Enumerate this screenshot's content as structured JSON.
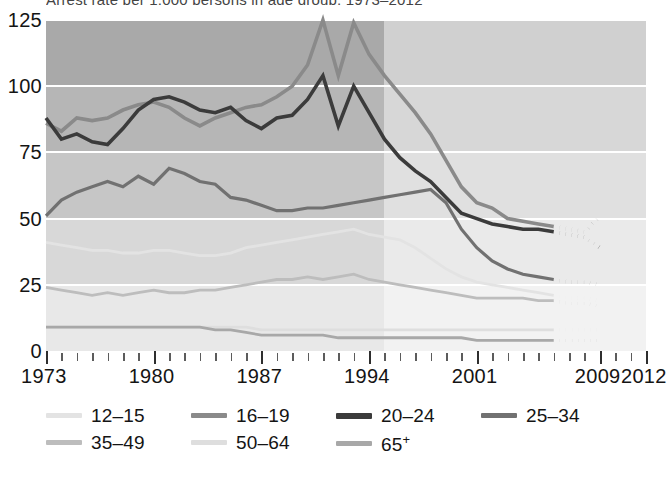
{
  "title_sliver": "Arrest rate per 1,000 persons in age group, 1973–2012",
  "axes": {
    "y_ticks": [
      0,
      25,
      50,
      75,
      100,
      125
    ],
    "y_min": 0,
    "y_max": 125,
    "x_labels": [
      "1973",
      "1980",
      "1987",
      "1994",
      "2001",
      "2009",
      "2012"
    ],
    "x_label_years": [
      1973,
      1980,
      1987,
      1994,
      2001,
      2009,
      2012
    ],
    "x_min": 1973,
    "x_max": 2012
  },
  "legend": {
    "row1": [
      {
        "label": "12–15",
        "color": "#e3e3e3",
        "key": "12-15"
      },
      {
        "label": "16–19",
        "color": "#8a8a8a",
        "key": "16-19"
      },
      {
        "label": "20–24",
        "color": "#3b3b3b",
        "key": "20-24"
      },
      {
        "label": "25–34",
        "color": "#717171",
        "key": "25-34"
      }
    ],
    "row2": [
      {
        "label": "35–49",
        "color": "#bdbdbd",
        "key": "35-49"
      },
      {
        "label": "50–64",
        "color": "#dedede",
        "key": "50-64"
      },
      {
        "label": "65",
        "sup": "+",
        "color": "#a8a8a8",
        "key": "65+"
      }
    ]
  },
  "chart_data": {
    "type": "line",
    "title": "Arrest rate per 1,000 persons in age group, 1973–2012",
    "xlabel": "",
    "ylabel": "",
    "xlim": [
      1973,
      2012
    ],
    "ylim": [
      0,
      125
    ],
    "grid": true,
    "grid_style": "horizontal white gridlines over gray bands",
    "legend_position": "below-plot",
    "x": [
      1973,
      1974,
      1975,
      1976,
      1977,
      1978,
      1979,
      1980,
      1981,
      1982,
      1983,
      1984,
      1985,
      1986,
      1987,
      1988,
      1989,
      1990,
      1991,
      1992,
      1993,
      1994,
      1995,
      1996,
      1997,
      1998,
      1999,
      2000,
      2001,
      2002,
      2003,
      2004,
      2005,
      2006,
      2007,
      2008,
      2009
    ],
    "series": [
      {
        "name": "12–15",
        "color": "#e3e3e3",
        "values": [
          41,
          40,
          39,
          38,
          38,
          37,
          37,
          38,
          38,
          37,
          36,
          36,
          37,
          39,
          40,
          41,
          42,
          43,
          44,
          45,
          46,
          44,
          43,
          42,
          39,
          35,
          31,
          28,
          26,
          25,
          24,
          23,
          22,
          21,
          20,
          20,
          19
        ],
        "dotted_gap_years": [
          2007,
          2008
        ],
        "end_value": 19
      },
      {
        "name": "16–19",
        "color": "#8a8a8a",
        "values": [
          86,
          83,
          88,
          87,
          88,
          91,
          93,
          94,
          92,
          88,
          85,
          88,
          90,
          92,
          93,
          96,
          100,
          108,
          125,
          104,
          124,
          112,
          104,
          97,
          90,
          82,
          72,
          62,
          56,
          54,
          50,
          49,
          48,
          47,
          46,
          45,
          51
        ],
        "dotted_gap_years": [
          2007,
          2008
        ],
        "end_value": 51
      },
      {
        "name": "20–24",
        "color": "#3b3b3b",
        "values": [
          88,
          80,
          82,
          79,
          78,
          84,
          91,
          95,
          96,
          94,
          91,
          90,
          92,
          87,
          84,
          88,
          89,
          95,
          104,
          85,
          100,
          90,
          80,
          73,
          68,
          64,
          58,
          52,
          50,
          48,
          47,
          46,
          46,
          45,
          44,
          43,
          39
        ],
        "dotted_gap_years": [
          2007,
          2008
        ],
        "end_value": 39
      },
      {
        "name": "25–34",
        "color": "#717171",
        "values": [
          51,
          57,
          60,
          62,
          64,
          62,
          66,
          63,
          69,
          67,
          64,
          63,
          58,
          57,
          55,
          53,
          53,
          54,
          54,
          55,
          56,
          57,
          58,
          59,
          60,
          61,
          56,
          46,
          39,
          34,
          31,
          29,
          28,
          27,
          26,
          26,
          25
        ],
        "dotted_gap_years": [
          2007,
          2008
        ],
        "end_value": 25
      },
      {
        "name": "35–49",
        "color": "#bdbdbd",
        "values": [
          24,
          23,
          22,
          21,
          22,
          21,
          22,
          23,
          22,
          22,
          23,
          23,
          24,
          25,
          26,
          27,
          27,
          28,
          27,
          28,
          29,
          27,
          26,
          25,
          24,
          23,
          22,
          21,
          20,
          20,
          20,
          20,
          19,
          19,
          18,
          18,
          17
        ],
        "dotted_gap_years": [
          2007,
          2008
        ],
        "end_value": 17
      },
      {
        "name": "50–64",
        "color": "#dedede",
        "values": [
          9,
          9,
          9,
          9,
          9,
          9,
          9,
          9,
          9,
          9,
          9,
          9,
          9,
          9,
          8,
          8,
          8,
          8,
          8,
          8,
          8,
          8,
          8,
          8,
          8,
          8,
          8,
          8,
          8,
          8,
          8,
          8,
          8,
          8,
          8,
          8,
          8
        ],
        "dotted_gap_years": [
          2007,
          2008
        ],
        "end_value": 8
      },
      {
        "name": "65⁺",
        "color": "#a8a8a8",
        "values": [
          9,
          9,
          9,
          9,
          9,
          9,
          9,
          9,
          9,
          9,
          9,
          8,
          8,
          7,
          6,
          6,
          6,
          6,
          6,
          5,
          5,
          5,
          5,
          5,
          5,
          5,
          5,
          5,
          4,
          4,
          4,
          4,
          4,
          4,
          4,
          4,
          4
        ],
        "dotted_gap_years": [
          2007,
          2008
        ],
        "end_value": 4
      }
    ],
    "background_bands": [
      {
        "from": 100,
        "to": 125,
        "color": "#a9a9a9"
      },
      {
        "from": 75,
        "to": 100,
        "color": "#b6b6b6"
      },
      {
        "from": 50,
        "to": 75,
        "color": "#c6c6c6"
      },
      {
        "from": 25,
        "to": 50,
        "color": "#d8d8d8"
      },
      {
        "from": 0,
        "to": 25,
        "color": "#e8e8e8"
      }
    ],
    "shade_break_year": 1995,
    "note": "Plot background is lighter to the right of 1995; line segments between 2006 and 2009 are drawn dotted."
  }
}
